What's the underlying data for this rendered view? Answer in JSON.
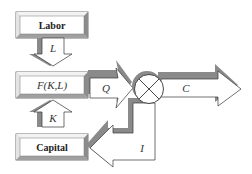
{
  "diagram": {
    "nodes": [
      {
        "id": "labor",
        "label": "Labor"
      },
      {
        "id": "production",
        "label": "F(K,L)"
      },
      {
        "id": "capital",
        "label": "Capital"
      },
      {
        "id": "splitter",
        "label": "⊗"
      }
    ],
    "flows": [
      {
        "id": "L",
        "label": "L",
        "from": "labor",
        "to": "production"
      },
      {
        "id": "K",
        "label": "K",
        "from": "capital",
        "to": "production"
      },
      {
        "id": "Q",
        "label": "Q",
        "from": "production",
        "to": "splitter"
      },
      {
        "id": "C",
        "label": "C",
        "from": "splitter",
        "to": "output"
      },
      {
        "id": "I",
        "label": "I",
        "from": "splitter",
        "to": "capital"
      }
    ]
  },
  "colors": {
    "shadow": "#8a8a8a",
    "stroke": "#333333",
    "fill": "#ffffff",
    "bevel_light": "#e8e8e8",
    "bevel_dark": "#9a9a9a"
  }
}
